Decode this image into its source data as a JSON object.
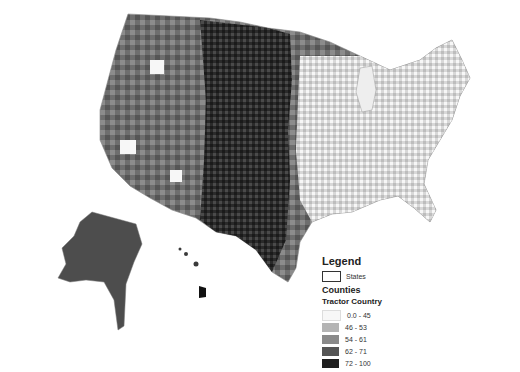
{
  "map": {
    "type": "choropleth",
    "subject": "US counties",
    "background": "#ffffff",
    "regions_shown": [
      "Contiguous United States",
      "Alaska",
      "Hawaii"
    ]
  },
  "legend": {
    "title": "Legend",
    "states_label": "States",
    "counties_label": "Counties",
    "layer_title": "Tractor Country",
    "classes": [
      {
        "label": "0.0 - 45",
        "color": "#f7f7f7"
      },
      {
        "label": "46 - 53",
        "color": "#b4b4b4"
      },
      {
        "label": "54 - 61",
        "color": "#8a8a8a"
      },
      {
        "label": "62 - 71",
        "color": "#555555"
      },
      {
        "label": "72 - 100",
        "color": "#1e1e1e"
      }
    ]
  }
}
